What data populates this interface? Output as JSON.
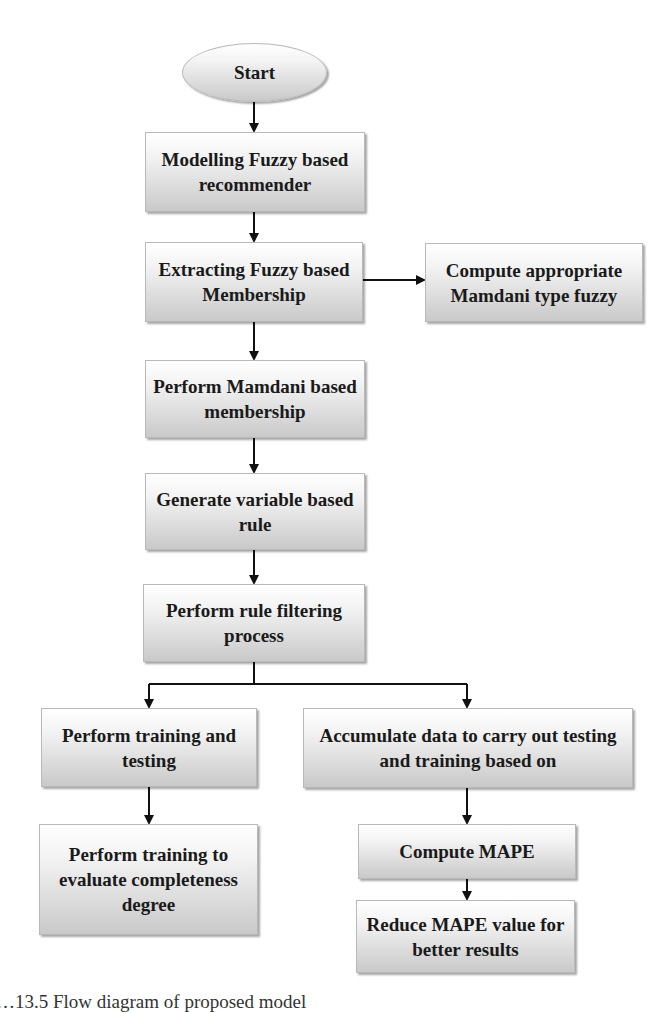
{
  "diagram": {
    "type": "flowchart",
    "nodes": {
      "start": "Start",
      "n1": "Modelling Fuzzy based recommender",
      "n2": "Extracting Fuzzy based Membership",
      "n2b": "Compute appropriate Mamdani type fuzzy",
      "n3": "Perform Mamdani based membership",
      "n4": "Generate variable based rule",
      "n5": "Perform rule filtering process",
      "l1": "Perform training and testing",
      "l2": "Perform training to evaluate completeness degree",
      "r1": "Accumulate data to carry out testing and training based on",
      "r2": "Compute MAPE",
      "r3": "Reduce MAPE value for better results"
    },
    "edges": [
      [
        "start",
        "n1"
      ],
      [
        "n1",
        "n2"
      ],
      [
        "n2",
        "n2b"
      ],
      [
        "n2",
        "n3"
      ],
      [
        "n3",
        "n4"
      ],
      [
        "n4",
        "n5"
      ],
      [
        "n5",
        "l1"
      ],
      [
        "n5",
        "r1"
      ],
      [
        "l1",
        "l2"
      ],
      [
        "r1",
        "r2"
      ],
      [
        "r2",
        "r3"
      ]
    ],
    "colors": {
      "box_top": "#ffffff",
      "box_bottom": "#c9c9c9",
      "arrow": "#111111"
    }
  },
  "caption": "…13.5  Flow diagram of proposed model"
}
